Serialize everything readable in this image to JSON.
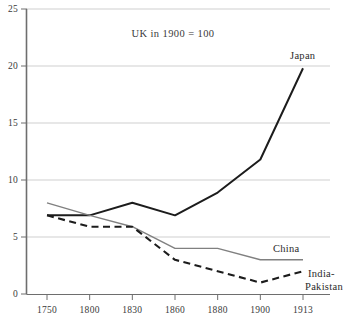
{
  "chart_data": {
    "type": "line",
    "title": "",
    "annotation": "UK in 1900 = 100",
    "xlabel": "",
    "ylabel": "",
    "categories": [
      "1750",
      "1800",
      "1830",
      "1860",
      "1880",
      "1900",
      "1913"
    ],
    "x_tick_labels": [
      "1750",
      "1800",
      "1830",
      "1860",
      "1880",
      "1900",
      "1913"
    ],
    "y_tick_labels": [
      "0",
      "5",
      "10",
      "15",
      "20",
      "25"
    ],
    "y_tick_values": [
      0,
      5,
      10,
      15,
      20,
      25
    ],
    "ylim": [
      0,
      25
    ],
    "grid": "horizontal",
    "legend_position": "inline-right-of-line-ends",
    "series": [
      {
        "name": "Japan",
        "label": "Japan",
        "style": "solid",
        "color": "#1c1c1c",
        "values": [
          6.9,
          6.9,
          8.0,
          6.9,
          8.9,
          11.8,
          19.8
        ]
      },
      {
        "name": "China",
        "label": "China",
        "style": "solid",
        "color": "#808080",
        "values": [
          8.0,
          6.9,
          5.9,
          4.0,
          4.0,
          3.0,
          3.0
        ]
      },
      {
        "name": "India-Pakistan",
        "label": "India-\nPakistan",
        "label_line1": "India-",
        "label_line2": "Pakistan",
        "style": "dashed",
        "color": "#1c1c1c",
        "values": [
          6.9,
          5.9,
          5.9,
          3.0,
          2.0,
          1.0,
          2.0
        ]
      }
    ]
  },
  "colors": {
    "background": "#ffffff",
    "axis": "#6e6e6e",
    "gridline": "#cfcfcf",
    "japan_line": "#1c1c1c",
    "china_line": "#808080",
    "india_line": "#1c1c1c",
    "text": "#3a3a3a"
  }
}
